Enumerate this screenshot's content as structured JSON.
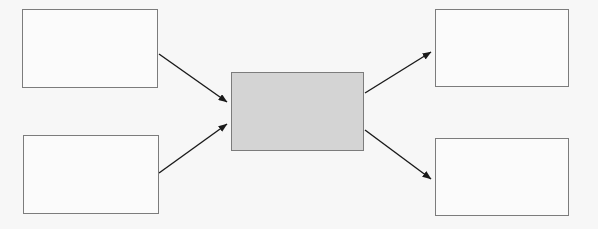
{
  "diagram": {
    "type": "flowchart",
    "title": "",
    "background_color": "#f7f7f7",
    "orientation": "left-to-right",
    "colors": {
      "box_border": "#7c7c7c",
      "box_fill": "#fbfbfb",
      "process_fill": "#d4d4d4",
      "arrow": "#1a1a1a"
    },
    "nodes": [
      {
        "id": "input-top",
        "label": "",
        "role": "input",
        "fill": "#fbfbfb",
        "x": 22,
        "y": 9,
        "width": 136,
        "height": 79
      },
      {
        "id": "input-bottom",
        "label": "",
        "role": "input",
        "fill": "#fbfbfb",
        "x": 23,
        "y": 135,
        "width": 136,
        "height": 79
      },
      {
        "id": "process-center",
        "label": "",
        "role": "process",
        "fill": "#d4d4d4",
        "x": 231,
        "y": 72,
        "width": 133,
        "height": 79
      },
      {
        "id": "output-top",
        "label": "",
        "role": "output",
        "fill": "#fbfbfb",
        "x": 435,
        "y": 9,
        "width": 134,
        "height": 78
      },
      {
        "id": "output-bottom",
        "label": "",
        "role": "output",
        "fill": "#fbfbfb",
        "x": 435,
        "y": 138,
        "width": 134,
        "height": 78
      }
    ],
    "edges": [
      {
        "id": "edge-input-top-to-process",
        "from": "input-top",
        "to": "process-center",
        "label": "",
        "x1": 159,
        "y1": 54,
        "x2": 227,
        "y2": 102
      },
      {
        "id": "edge-input-bottom-to-process",
        "from": "input-bottom",
        "to": "process-center",
        "label": "",
        "x1": 159,
        "y1": 173,
        "x2": 227,
        "y2": 124
      },
      {
        "id": "edge-process-to-output-top",
        "from": "process-center",
        "to": "output-top",
        "label": "",
        "x1": 365,
        "y1": 93,
        "x2": 431,
        "y2": 52
      },
      {
        "id": "edge-process-to-output-bottom",
        "from": "process-center",
        "to": "output-bottom",
        "label": "",
        "x1": 365,
        "y1": 130,
        "x2": 431,
        "y2": 179
      }
    ]
  }
}
